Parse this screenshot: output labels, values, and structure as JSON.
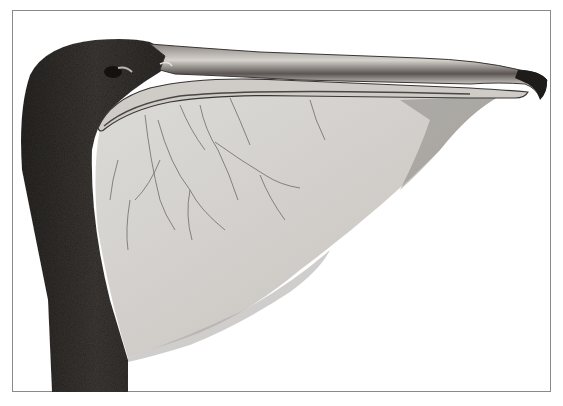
{
  "image": {
    "subject": "Pelican head with throat pouch and bill (illustration)",
    "alt": "Engraved illustration of a pelican's dark head and neck with a long pale bill and large pale throat pouch with branching veins",
    "colors": {
      "background": "#ffffff",
      "frame": "#8a8a8a",
      "head_dark": "#2e2a28",
      "neck_dark": "#3a3634",
      "pouch_light": "#d4d2cf",
      "pouch_shade": "#a9a6a2",
      "bill_light": "#cfcbc6",
      "bill_dark": "#4a4644",
      "vein": "#6b6663"
    }
  }
}
